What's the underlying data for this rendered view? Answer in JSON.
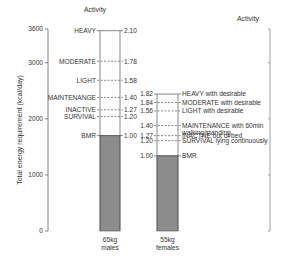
{
  "chart_data": {
    "type": "bar",
    "title": "",
    "ylabel": "Total energy requirement (kcal/day)",
    "xlabel": "",
    "ylim": [
      0,
      3600
    ],
    "yticks": [
      0,
      1000,
      2000,
      3000,
      3600
    ],
    "left_header": "Activity",
    "right_header": "Activity",
    "categories": [
      "65kg males",
      "55kg females"
    ],
    "series": [
      {
        "name": "65kg males",
        "label_line1": "65kg",
        "label_line2": "males",
        "bmr_kcal": 1700,
        "levels": [
          {
            "name": "HEAVY",
            "factor": "2.10",
            "kcal": 3570,
            "solid": true
          },
          {
            "name": "MODERATE",
            "factor": "1.78",
            "kcal": 3026
          },
          {
            "name": "LIGHT",
            "factor": "1.58",
            "kcal": 2686
          },
          {
            "name": "MAINTENANGE",
            "factor": "1.40",
            "kcal": 2380
          },
          {
            "name": "INACTIVE",
            "factor": "1.27",
            "kcal": 2159
          },
          {
            "name": "SURVIVAL",
            "factor": "1.20",
            "kcal": 2040
          },
          {
            "name": "BMR",
            "factor": "1.00",
            "kcal": 1700
          }
        ]
      },
      {
        "name": "55kg females",
        "label_line1": "55kg",
        "label_line2": "females",
        "bmr_kcal": 1340,
        "levels": [
          {
            "name": "HEAVY with desirable",
            "factor": "1.82",
            "kcal": 2440,
            "solid": true
          },
          {
            "name": "MODERATE with desirable",
            "factor": "1.84",
            "kcal": 2290
          },
          {
            "name": "LIGHT with desirable",
            "factor": "1.56",
            "kcal": 2140
          },
          {
            "name": "MAINTENANCE with 60min walking/standing",
            "factor": "1.40",
            "kcal": 1880
          },
          {
            "name": "INACTNE out of bed",
            "factor": "1.27",
            "kcal": 1700
          },
          {
            "name": "SURVIVAL lying continuously",
            "factor": "1.20",
            "kcal": 1610
          },
          {
            "name": "BMR",
            "factor": "1.00",
            "kcal": 1340
          }
        ]
      }
    ],
    "colors": {
      "bmr_fill": "#8c8c8c",
      "axis": "#666666",
      "line": "#555555"
    }
  }
}
